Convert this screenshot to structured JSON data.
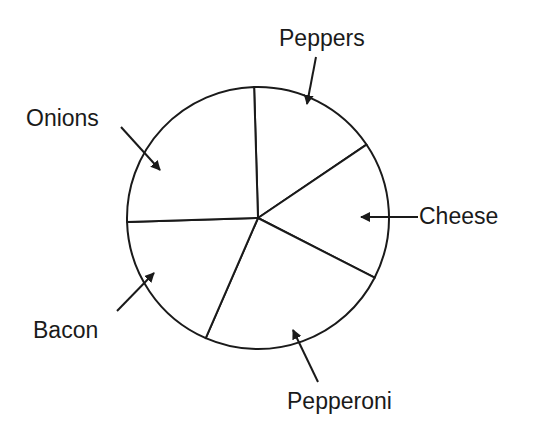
{
  "chart_data": {
    "type": "pie",
    "title": "",
    "style": {
      "fill": "#ffffff",
      "stroke": "#1a1a1a",
      "text_color": "#1a1a1a",
      "background": "#ffffff"
    },
    "geometry": {
      "cx": 258,
      "cy": 218,
      "r": 131
    },
    "start_angle_deg": -1.7,
    "categories": [
      "Peppers",
      "Cheese",
      "Pepperoni",
      "Bacon",
      "Onions"
    ],
    "values": [
      16,
      17,
      24,
      18,
      25
    ],
    "unit": "percent (estimated from slice angles; no values printed)",
    "legend": "none — slices labeled with callout arrows",
    "labels": [
      {
        "text": "Peppers",
        "x": 279,
        "y": 27,
        "arrow": [
          [
            316,
            57
          ],
          [
            307,
            104
          ]
        ]
      },
      {
        "text": "Cheese",
        "x": 419,
        "y": 205,
        "arrow": [
          [
            418,
            217
          ],
          [
            361,
            217
          ]
        ]
      },
      {
        "text": "Pepperoni",
        "x": 287,
        "y": 390,
        "arrow": [
          [
            318,
            382
          ],
          [
            293,
            330
          ]
        ]
      },
      {
        "text": "Bacon",
        "x": 33,
        "y": 319,
        "arrow": [
          [
            117,
            311
          ],
          [
            154,
            273
          ]
        ]
      },
      {
        "text": "Onions",
        "x": 26,
        "y": 107,
        "arrow": [
          [
            121,
            127
          ],
          [
            160,
            170
          ]
        ]
      }
    ]
  }
}
